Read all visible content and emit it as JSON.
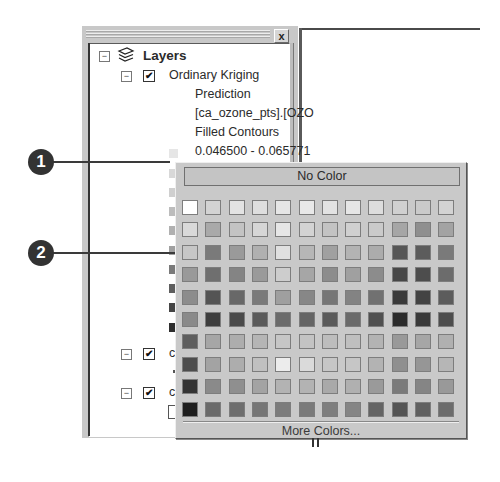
{
  "layers_panel": {
    "close_label": "x",
    "root": {
      "label": "Layers",
      "expander": "−",
      "icon": "layers-stack-icon"
    },
    "layer": {
      "label": "Ordinary Kriging",
      "expander": "−",
      "checked": true,
      "check_glyph": "✔",
      "sub_items": [
        "Prediction",
        "[ca_ozone_pts].[OZO",
        "Filled Contours",
        "0.046500 - 0.065771"
      ]
    },
    "legend_swatches": [
      "#e6e6e6",
      "#d8d8d8",
      "#cfcfcf",
      "#bcbcbc",
      "#a8a8a8",
      "#929292",
      "#6f6f6f",
      "#585858",
      "#434343",
      "#2e2e2e"
    ],
    "lower_layers": [
      {
        "expander": "−",
        "checked": true,
        "check_glyph": "✔",
        "label_fragment": "c"
      },
      {
        "expander": "−",
        "checked": true,
        "check_glyph": "✔",
        "label_fragment": "c"
      }
    ]
  },
  "callouts": [
    {
      "number": "1",
      "target": "legend-swatch"
    },
    {
      "number": "2",
      "target": "color-swatch"
    }
  ],
  "color_picker": {
    "no_color_label": "No Color",
    "more_colors_label": "More Colors...",
    "rows": [
      [
        "#ffffff",
        "#d3d3d3",
        "#e3e3e3",
        "#dedede",
        "#e6e6e6",
        "#e8e8e8",
        "#e3e3e3",
        "#e6e6e6",
        "#dddddd",
        "#d0d0d0",
        "#cacaca",
        "#d3d3d3"
      ],
      [
        "#d9d9d9",
        "#a9a9a9",
        "#c3c3c3",
        "#d6d6d6",
        "#e6e6e6",
        "#d3d3d3",
        "#c3c3c3",
        "#d0d0d0",
        "#cacaca",
        "#a6a6a6",
        "#8f8f8f",
        "#a3a3a3"
      ],
      [
        "#c6c6c6",
        "#7a7a7a",
        "#9a9a9a",
        "#b0b0b0",
        "#e0e0e0",
        "#b6b6b6",
        "#a0a0a0",
        "#b3b3b3",
        "#acacac",
        "#565656",
        "#5c5c5c",
        "#7a7a7a"
      ],
      [
        "#999999",
        "#6f6f6f",
        "#848484",
        "#9a9a9a",
        "#cdcdcd",
        "#a6a6a6",
        "#8c8c8c",
        "#a0a0a0",
        "#8c8c8c",
        "#474747",
        "#4d4d4d",
        "#6c6c6c"
      ],
      [
        "#8c8c8c",
        "#545454",
        "#686868",
        "#7a7a7a",
        "#9f9f9f",
        "#878787",
        "#767676",
        "#838383",
        "#717171",
        "#3a3a3a",
        "#434343",
        "#5c5c5c"
      ],
      [
        "#8a8a8a",
        "#3e3e3e",
        "#4a4a4a",
        "#5a5a5a",
        "#6b6b6b",
        "#646464",
        "#5a5a5a",
        "#6a6a6a",
        "#505050",
        "#2c2c2c",
        "#3a3a3a",
        "#4d4d4d"
      ],
      [
        "#5e5e5e",
        "#a6a6a6",
        "#adadad",
        "#b5b5b5",
        "#c6c6c6",
        "#c3c3c3",
        "#bdbdbd",
        "#bfbfbf",
        "#b3b3b3",
        "#999999",
        "#a6a6a6",
        "#b0b0b0"
      ],
      [
        "#4d4d4d",
        "#a3a3a3",
        "#adadad",
        "#c0c0c0",
        "#ececec",
        "#dadada",
        "#c6c6c6",
        "#c6c6c6",
        "#b3b3b3",
        "#8f8f8f",
        "#969696",
        "#b6b6b6"
      ],
      [
        "#333333",
        "#8a8a8a",
        "#8f8f8f",
        "#a3a3a3",
        "#b3b3b3",
        "#b3b3b3",
        "#a9a9a9",
        "#b0b0b0",
        "#9a9a9a",
        "#7a7a7a",
        "#858585",
        "#999999"
      ],
      [
        "#1e1e1e",
        "#6a6a6a",
        "#6e6e6e",
        "#767676",
        "#7c7c7c",
        "#7a7a7a",
        "#7e7e7e",
        "#858585",
        "#646464",
        "#545454",
        "#606060",
        "#6c6c6c"
      ]
    ]
  }
}
